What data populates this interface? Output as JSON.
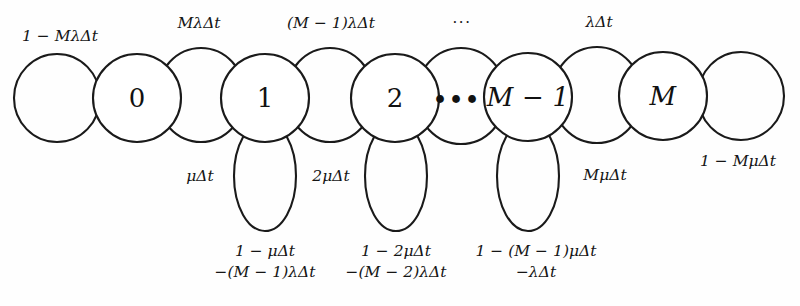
{
  "diagram": {
    "type": "markov-chain-state-transition",
    "title_visible": false,
    "background_color": "#fefefe",
    "stroke_color": "#1a1a1a",
    "states": [
      {
        "id": "s0",
        "label": "0",
        "cx": 137,
        "cy": 98,
        "r": 44,
        "italic": false
      },
      {
        "id": "s1",
        "label": "1",
        "cx": 265,
        "cy": 98,
        "r": 44,
        "italic": false
      },
      {
        "id": "s2",
        "label": "2",
        "cx": 395,
        "cy": 98,
        "r": 44,
        "italic": false
      },
      {
        "id": "sdots",
        "label": "•••",
        "cx": 457,
        "cy": 99,
        "r": 0,
        "italic": false
      },
      {
        "id": "sM1",
        "label": "M − 1",
        "cx": 528,
        "cy": 97,
        "r": 44,
        "italic": true
      },
      {
        "id": "sM",
        "label": "M",
        "cx": 663,
        "cy": 96,
        "r": 44,
        "italic": true
      }
    ],
    "transition_loops": [
      {
        "id": "loop-left-0",
        "cx": 57,
        "cy": 98,
        "rx": 43,
        "ry": 44
      },
      {
        "id": "loop-0-1",
        "cx": 201,
        "cy": 95,
        "rx": 44,
        "ry": 47
      },
      {
        "id": "loop-1-2",
        "cx": 330,
        "cy": 95,
        "rx": 44,
        "ry": 47
      },
      {
        "id": "loop-2-dots",
        "cx": 461,
        "cy": 96,
        "rx": 45,
        "ry": 48
      },
      {
        "id": "loop-M1-M",
        "cx": 597,
        "cy": 95,
        "rx": 45,
        "ry": 48
      },
      {
        "id": "loop-right-M",
        "cx": 741,
        "cy": 96,
        "rx": 43,
        "ry": 44
      }
    ],
    "self_loops": [
      {
        "id": "self-1",
        "cx": 265,
        "cy": 176,
        "rx": 31,
        "ry": 55
      },
      {
        "id": "self-2",
        "cx": 396,
        "cy": 176,
        "rx": 31,
        "ry": 55
      },
      {
        "id": "self-M1",
        "cx": 528,
        "cy": 176,
        "rx": 31,
        "ry": 55
      }
    ],
    "labels": {
      "top": [
        {
          "id": "label-stay-0",
          "text": "1 − MλΔt",
          "x": 60,
          "y": 36
        },
        {
          "id": "label-birth-0",
          "text": "MλΔt",
          "x": 199,
          "y": 23
        },
        {
          "id": "label-birth-1",
          "text": "(M − 1)λΔt",
          "x": 331,
          "y": 23
        },
        {
          "id": "label-top-dots",
          "text": "···",
          "x": 462,
          "y": 22
        },
        {
          "id": "label-birth-M1",
          "text": "λΔt",
          "x": 599,
          "y": 22
        }
      ],
      "middle": [
        {
          "id": "label-death-1",
          "text": "μΔt",
          "x": 200,
          "y": 176
        },
        {
          "id": "label-death-2",
          "text": "2μΔt",
          "x": 331,
          "y": 176
        },
        {
          "id": "label-death-M",
          "text": "MμΔt",
          "x": 605,
          "y": 175
        },
        {
          "id": "label-stay-M",
          "text": "1 − MμΔt",
          "x": 738,
          "y": 161
        }
      ],
      "bottom": [
        {
          "id": "label-stay-1",
          "line1": "1 − μΔt",
          "line2": "−(M − 1)λΔt",
          "x": 265,
          "y": 262
        },
        {
          "id": "label-stay-2",
          "line1": "1 − 2μΔt",
          "line2": "−(M − 2)λΔt",
          "x": 396,
          "y": 262
        },
        {
          "id": "label-stay-M1",
          "line1": "1 − (M − 1)μΔt",
          "line2": "−λΔt",
          "x": 536,
          "y": 262
        }
      ]
    }
  }
}
